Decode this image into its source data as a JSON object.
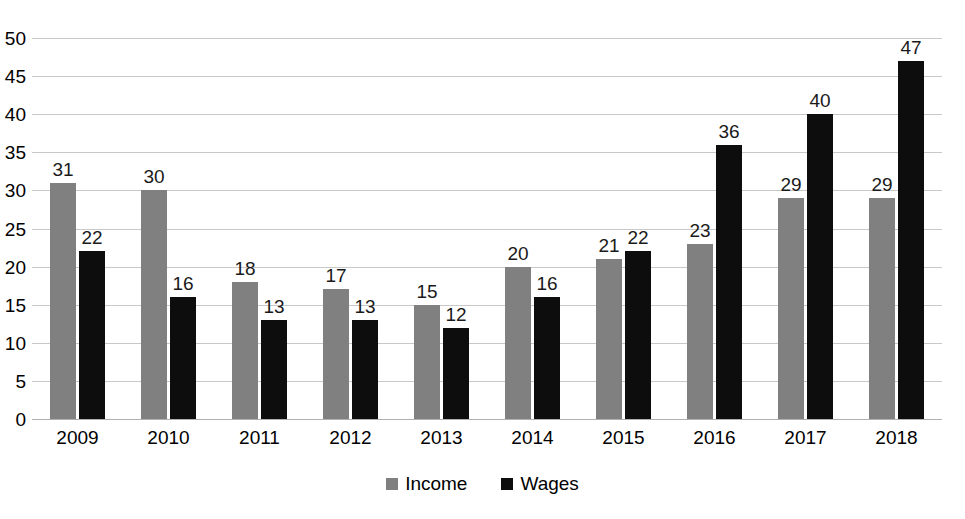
{
  "chart_data": {
    "type": "bar",
    "title": "",
    "subtitle": "",
    "xlabel": "",
    "ylabel": "",
    "categories": [
      "2009",
      "2010",
      "2011",
      "2012",
      "2013",
      "2014",
      "2015",
      "2016",
      "2017",
      "2018"
    ],
    "series": [
      {
        "name": "Income",
        "color": "#808080",
        "values": [
          31,
          30,
          18,
          17,
          15,
          20,
          21,
          23,
          29,
          29
        ]
      },
      {
        "name": "Wages",
        "color": "#0d0d0d",
        "values": [
          22,
          16,
          13,
          13,
          12,
          16,
          22,
          36,
          40,
          47
        ]
      }
    ],
    "ylim": [
      0,
      50
    ],
    "y_ticks": [
      0,
      5,
      10,
      15,
      20,
      25,
      30,
      35,
      40,
      45,
      50
    ],
    "y_tick_labels": [
      "0",
      "5",
      "10",
      "15",
      "20",
      "25",
      "30",
      "35",
      "40",
      "45",
      "50"
    ],
    "grid": true,
    "grid_color": "#c8c8c8",
    "data_labels": true,
    "legend_position": "bottom",
    "background_color": "#ffffff"
  },
  "legend": {
    "items": [
      {
        "label": "Income",
        "swatch": "income-swatch",
        "color": "#808080"
      },
      {
        "label": "Wages",
        "swatch": "wages-swatch",
        "color": "#0d0d0d"
      }
    ]
  }
}
